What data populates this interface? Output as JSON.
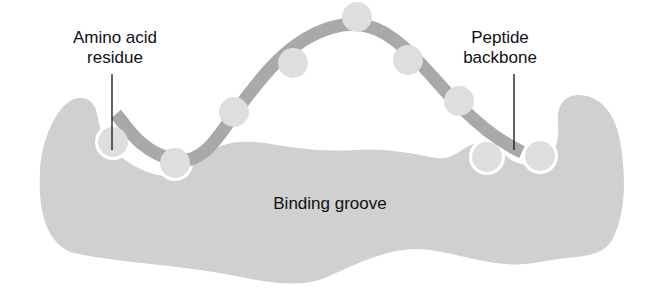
{
  "diagram": {
    "labels": {
      "amino_acid_residue": [
        "Amino acid",
        "residue"
      ],
      "peptide_backbone": [
        "Peptide",
        "backbone"
      ],
      "binding_groove": "Binding groove"
    },
    "colors": {
      "background": "#ffffff",
      "groove_fill": "#d0d0d0",
      "backbone_stroke": "#a9a9a9",
      "residue_fill": "#dedede",
      "residue_halo": "#ffffff",
      "leader_line": "#111111",
      "text": "#111111"
    },
    "residue_count": 9
  }
}
